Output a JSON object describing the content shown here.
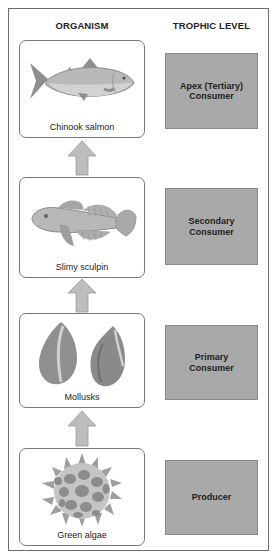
{
  "headers": {
    "organism": "ORGANISM",
    "trophic_level": "TROPHIC LEVEL"
  },
  "levels": [
    {
      "organism": "Chinook salmon",
      "trophic": "Apex (Tertiary)\nConsumer",
      "icon": "salmon-icon"
    },
    {
      "organism": "Slimy sculpin",
      "trophic": "Secondary\nConsumer",
      "icon": "sculpin-icon"
    },
    {
      "organism": "Mollusks",
      "trophic": "Primary\nConsumer",
      "icon": "mollusk-shells-icon"
    },
    {
      "organism": "Green algae",
      "trophic": "Producer",
      "icon": "green-algae-icon"
    }
  ],
  "colors": {
    "trophic_fill": "#a9a9a9",
    "arrow_fill": "#bdbdbd",
    "organism_art": "#8f8f8f",
    "frame_border": "#6b6b6b"
  }
}
